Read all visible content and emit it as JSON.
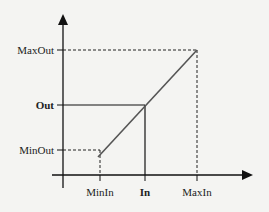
{
  "diagram": {
    "type": "linear-scaling-transfer-function",
    "y_axis_labels": {
      "max_out": "MaxOut",
      "out": "Out",
      "min_out": "MinOut"
    },
    "x_axis_labels": {
      "min_in": "MinIn",
      "in": "In",
      "max_in": "MaxIn"
    },
    "colors": {
      "axis": "#111111",
      "line": "#555555",
      "background": "#f4f4f2"
    }
  }
}
